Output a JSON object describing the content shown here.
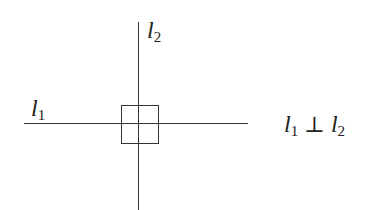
{
  "diagram": {
    "type": "perpendicular-lines",
    "line1": {
      "label_main": "l",
      "label_sub": "1"
    },
    "line2": {
      "label_main": "l",
      "label_sub": "2"
    },
    "relation": {
      "left_main": "l",
      "left_sub": "1",
      "symbol": "⊥",
      "right_main": "l",
      "right_sub": "2"
    },
    "right_angle_marker": "square",
    "stroke_color": "#333333"
  }
}
